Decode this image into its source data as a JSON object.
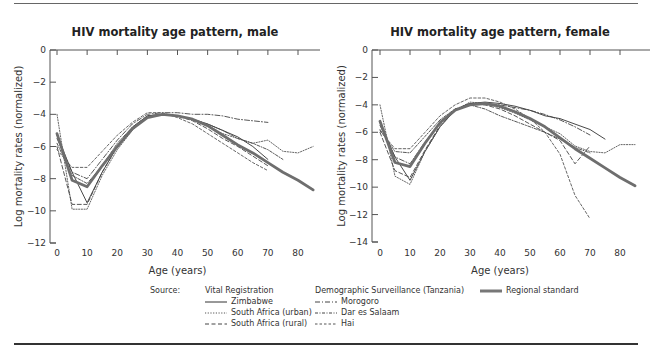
{
  "chart_data": [
    {
      "type": "line",
      "title": "HIV mortality age pattern, male",
      "xlabel": "Age (years)",
      "ylabel": "Log mortality rates (normalized)",
      "xlim": [
        0,
        85
      ],
      "ylim": [
        -12,
        0
      ],
      "xticks": [
        0,
        10,
        20,
        30,
        40,
        50,
        60,
        70,
        80
      ],
      "yticks": [
        0,
        -2,
        -4,
        -6,
        -8,
        -10,
        -12
      ],
      "grid": false,
      "series": [
        {
          "name": "Zimbabwe",
          "style": "solid",
          "x": [
            0,
            5,
            10,
            15,
            20,
            25,
            30,
            35,
            40,
            45,
            50,
            55,
            60,
            65,
            70
          ],
          "y": [
            -5.3,
            -7.6,
            -9.5,
            -7.6,
            -6.0,
            -4.8,
            -4.1,
            -4.0,
            -4.1,
            -4.3,
            -4.6,
            -5.0,
            -5.4,
            -6.0,
            -6.8
          ]
        },
        {
          "name": "South Africa (urban)",
          "style": "dotted",
          "x": [
            0,
            5,
            10,
            15,
            20,
            25,
            30,
            35,
            40,
            45,
            50,
            55,
            60,
            65,
            70,
            75,
            80,
            85
          ],
          "y": [
            -4.0,
            -9.9,
            -9.9,
            -7.8,
            -6.2,
            -5.0,
            -4.1,
            -4.0,
            -4.1,
            -4.3,
            -4.7,
            -5.2,
            -5.5,
            -5.8,
            -5.6,
            -6.3,
            -6.4,
            -6.0
          ]
        },
        {
          "name": "South Africa (rural)",
          "style": "dashed",
          "x": [
            0,
            5,
            10,
            15,
            20,
            25,
            30,
            35,
            40,
            45,
            50,
            55,
            60,
            65,
            70
          ],
          "y": [
            -6.0,
            -9.6,
            -9.6,
            -7.6,
            -6.0,
            -4.9,
            -4.2,
            -4.0,
            -4.1,
            -4.4,
            -4.9,
            -5.5,
            -6.0,
            -6.6,
            -7.2
          ]
        },
        {
          "name": "Morogoro",
          "style": "dashdot",
          "x": [
            0,
            5,
            10,
            15,
            20,
            25,
            30,
            35,
            40,
            45,
            50,
            55,
            60,
            65,
            70
          ],
          "y": [
            -5.5,
            -7.6,
            -8.0,
            -6.8,
            -5.6,
            -4.6,
            -4.0,
            -3.9,
            -3.9,
            -4.0,
            -4.0,
            -4.1,
            -4.3,
            -4.4,
            -4.5
          ]
        },
        {
          "name": "Dar es Salaam",
          "style": "longdash",
          "x": [
            0,
            5,
            10,
            15,
            20,
            25,
            30,
            35,
            40,
            45,
            50,
            55,
            60,
            65,
            70,
            75
          ],
          "y": [
            -5.8,
            -7.8,
            -8.3,
            -7.2,
            -5.8,
            -4.8,
            -4.1,
            -4.0,
            -4.1,
            -4.3,
            -4.6,
            -5.0,
            -5.5,
            -5.8,
            -6.2,
            -6.8
          ]
        },
        {
          "name": "Hai",
          "style": "shortdash",
          "x": [
            0,
            5,
            10,
            15,
            20,
            25,
            30,
            35,
            40,
            45,
            50,
            55,
            60,
            65,
            70
          ],
          "y": [
            -6.2,
            -7.3,
            -7.3,
            -6.3,
            -5.3,
            -4.5,
            -3.9,
            -3.9,
            -4.2,
            -4.6,
            -5.2,
            -5.8,
            -6.4,
            -7.0,
            -7.5
          ]
        },
        {
          "name": "Regional standard",
          "style": "thick",
          "x": [
            0,
            5,
            10,
            15,
            20,
            25,
            30,
            35,
            40,
            45,
            50,
            55,
            60,
            65,
            70,
            75,
            80,
            85
          ],
          "y": [
            -5.2,
            -8.1,
            -8.5,
            -7.2,
            -6.0,
            -4.9,
            -4.2,
            -4.0,
            -4.1,
            -4.3,
            -4.7,
            -5.3,
            -5.9,
            -6.4,
            -7.0,
            -7.6,
            -8.1,
            -8.7
          ]
        }
      ]
    },
    {
      "type": "line",
      "title": "HIV mortality age pattern, female",
      "xlabel": "Age (years)",
      "ylabel": "Log mortality rates (normalized)",
      "xlim": [
        0,
        85
      ],
      "ylim": [
        -14,
        0
      ],
      "xticks": [
        0,
        10,
        20,
        30,
        40,
        50,
        60,
        70,
        80
      ],
      "yticks": [
        0,
        -2,
        -4,
        -6,
        -8,
        -10,
        -12,
        -14
      ],
      "grid": false,
      "series": [
        {
          "name": "Zimbabwe",
          "style": "solid",
          "x": [
            0,
            5,
            10,
            15,
            20,
            25,
            30,
            35,
            40,
            45,
            50,
            55,
            60,
            65,
            70,
            75
          ],
          "y": [
            -5.3,
            -7.8,
            -9.5,
            -7.4,
            -5.6,
            -4.4,
            -3.9,
            -3.8,
            -3.9,
            -4.1,
            -4.4,
            -4.8,
            -5.0,
            -5.4,
            -5.8,
            -6.5
          ]
        },
        {
          "name": "South Africa (urban)",
          "style": "dotted",
          "x": [
            0,
            5,
            10,
            15,
            20,
            25,
            30,
            35,
            40,
            45,
            50,
            55,
            60,
            65,
            70,
            75,
            80,
            85
          ],
          "y": [
            -4.0,
            -9.2,
            -9.8,
            -7.4,
            -5.6,
            -4.4,
            -3.8,
            -3.9,
            -4.2,
            -4.6,
            -5.1,
            -5.6,
            -6.1,
            -7.0,
            -7.4,
            -7.5,
            -6.9,
            -6.9
          ]
        },
        {
          "name": "South Africa (rural)",
          "style": "dashed",
          "x": [
            0,
            5,
            10,
            15,
            20,
            25,
            30,
            35,
            40,
            45,
            50,
            55,
            60,
            65,
            70
          ],
          "y": [
            -6.0,
            -8.8,
            -9.3,
            -7.3,
            -5.5,
            -4.4,
            -3.9,
            -4.0,
            -4.3,
            -4.8,
            -5.4,
            -6.0,
            -6.6,
            -8.3,
            -7.0
          ]
        },
        {
          "name": "Morogoro",
          "style": "dashdot",
          "x": [
            0,
            5,
            10,
            15,
            20,
            25,
            30,
            35,
            40,
            45,
            50,
            55,
            60,
            65,
            70
          ],
          "y": [
            -5.5,
            -7.8,
            -8.3,
            -6.7,
            -5.3,
            -4.3,
            -3.9,
            -3.9,
            -4.0,
            -4.2,
            -4.4,
            -4.7,
            -5.1,
            -5.6,
            -6.2
          ]
        },
        {
          "name": "Dar es Salaam",
          "style": "longdash",
          "x": [
            0,
            5,
            10,
            15,
            20,
            25,
            30,
            35,
            40,
            45,
            50,
            55,
            60,
            65,
            70
          ],
          "y": [
            -5.8,
            -7.4,
            -7.5,
            -6.3,
            -5.1,
            -4.3,
            -4.0,
            -4.3,
            -4.8,
            -5.2,
            -5.6,
            -6.0,
            -6.5,
            -7.1,
            -7.5
          ]
        },
        {
          "name": "Hai",
          "style": "shortdash",
          "x": [
            0,
            5,
            10,
            15,
            20,
            25,
            30,
            35,
            40,
            45,
            50,
            55,
            60,
            65,
            70
          ],
          "y": [
            -5.9,
            -7.2,
            -7.2,
            -6.0,
            -4.8,
            -4.0,
            -3.5,
            -3.5,
            -3.8,
            -4.3,
            -5.0,
            -6.0,
            -7.6,
            -10.6,
            -12.3
          ]
        },
        {
          "name": "Regional standard",
          "style": "thick",
          "x": [
            0,
            5,
            10,
            15,
            20,
            25,
            30,
            35,
            40,
            45,
            50,
            55,
            60,
            65,
            70,
            75,
            80,
            85
          ],
          "y": [
            -5.2,
            -8.2,
            -8.5,
            -6.8,
            -5.3,
            -4.4,
            -4.0,
            -3.9,
            -4.1,
            -4.5,
            -5.0,
            -5.6,
            -6.4,
            -7.2,
            -7.9,
            -8.6,
            -9.3,
            -9.9
          ]
        }
      ]
    }
  ],
  "legend": {
    "source_label": "Source:",
    "group1_title": "Vital Registration",
    "group1_items": [
      "Zimbabwe",
      "South Africa (urban)",
      "South Africa (rural)"
    ],
    "group2_title": "Demographic Surveillance (Tanzania)",
    "group2_items": [
      "Morogoro",
      "Dar es Salaam",
      "Hai"
    ],
    "standard_label": "Regional standard"
  }
}
